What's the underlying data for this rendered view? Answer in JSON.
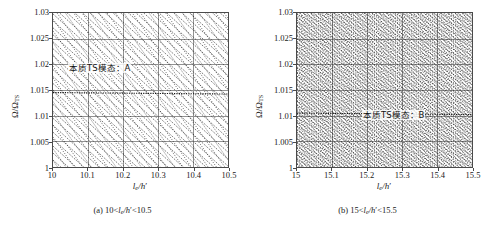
{
  "figure": {
    "panels": [
      {
        "id": "panel-a",
        "annotation": "本质TS模态：A",
        "subcaption_prefix": "(a) 10<",
        "subcaption_var": "l",
        "subcaption_sub": "e",
        "subcaption_mid": "/h",
        "subcaption_suffix": "<10.5",
        "xlabel_var": "l",
        "xlabel_sub": "e",
        "xlabel_den": "/h",
        "ylabel_num": "Ω/Ω",
        "ylabel_sub": "TS",
        "xticks": [
          "10",
          "10.1",
          "10.2",
          "10.3",
          "10.4",
          "10.5"
        ],
        "yticks": [
          "1",
          "1.005",
          "1.01",
          "1.015",
          "1.02",
          "1.025",
          "1.03"
        ]
      },
      {
        "id": "panel-b",
        "annotation": "本质TS模态：B",
        "subcaption_prefix": "(b) 15<",
        "subcaption_var": "l",
        "subcaption_sub": "e",
        "subcaption_mid": "/h",
        "subcaption_suffix": "<15.5",
        "xlabel_var": "l",
        "xlabel_sub": "e",
        "xlabel_den": "/h",
        "ylabel_num": "Ω/Ω",
        "ylabel_sub": "TS",
        "xticks": [
          "15",
          "15.1",
          "15.2",
          "15.3",
          "15.4",
          "15.5"
        ],
        "yticks": [
          "1",
          "1.005",
          "1.01",
          "1.015",
          "1.02",
          "1.025",
          "1.03"
        ]
      }
    ]
  },
  "chart_data": [
    {
      "type": "line",
      "title": "(a) 10<le/h'<10.5",
      "xlabel": "le/h'",
      "ylabel": "Omega/Omega_TS",
      "xlim": [
        10,
        10.5
      ],
      "ylim": [
        1,
        1.03
      ],
      "xticks": [
        10,
        10.1,
        10.2,
        10.3,
        10.4,
        10.5
      ],
      "yticks": [
        1,
        1.005,
        1.01,
        1.015,
        1.02,
        1.025,
        1.03
      ],
      "grid": true,
      "legend": "none",
      "annotations": [
        {
          "text": "本质TS模态：A",
          "x": 10.05,
          "y": 1.0175
        }
      ],
      "series_description": "Dense family of descending dotted eigenvalue branches (negative slope ~ -0.035 in Omega per unit le/h'), each branch entering from the upper-left and exiting lower-right; roughly 45 branches cross the window. One nearly-horizontal branch (the intrinsic TS mode A) sits at Omega/Omega_TS ≈ 1.0145 and stays flat across the whole x range.",
      "branch_count": 45,
      "branch_slope": -0.062,
      "flat_branch_y": 1.0145
    },
    {
      "type": "line",
      "title": "(b) 15<le/h'<15.5",
      "xlabel": "le/h'",
      "ylabel": "Omega/Omega_TS",
      "xlim": [
        15,
        15.5
      ],
      "ylim": [
        1,
        1.03
      ],
      "xticks": [
        15,
        15.1,
        15.2,
        15.3,
        15.4,
        15.5
      ],
      "yticks": [
        1,
        1.005,
        1.01,
        1.015,
        1.02,
        1.025,
        1.03
      ],
      "grid": true,
      "legend": "none",
      "annotations": [
        {
          "text": "本质TS模态：B",
          "x": 15.22,
          "y": 1.0105
        }
      ],
      "series_description": "Much denser family of descending dotted eigenvalue branches than panel (a); roughly 100 branches with steeper apparent crowding fill the window uniformly, producing a moiré texture. The intrinsic TS mode B is embedded near Omega/Omega_TS ≈ 1.010.",
      "branch_count": 100,
      "branch_slope": -0.062,
      "flat_branch_y": 1.0105
    }
  ]
}
